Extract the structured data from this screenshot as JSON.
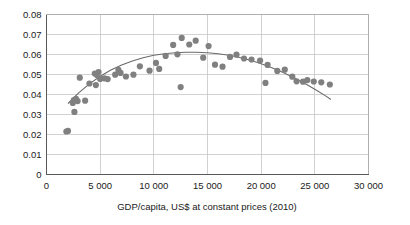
{
  "chart_data": {
    "type": "scatter",
    "title": "",
    "subtitle": "",
    "xlabel": "GDP/capita, US$ at constant prices (2010)",
    "ylabel": "",
    "xlim": [
      0,
      30000
    ],
    "ylim": [
      0,
      0.08
    ],
    "grid": true,
    "legend": "none",
    "x_ticks": [
      0,
      5000,
      10000,
      15000,
      20000,
      25000,
      30000
    ],
    "x_tick_labels": [
      "0",
      "5 000",
      "10 000",
      "15 000",
      "20 000",
      "25 000",
      "30 000"
    ],
    "y_ticks": [
      0,
      0.01,
      0.02,
      0.03,
      0.04,
      0.05,
      0.06,
      0.07,
      0.08
    ],
    "y_tick_labels": [
      "0",
      "0.01",
      "0.02",
      "0.03",
      "0.04",
      "0.05",
      "0.06",
      "0.07",
      "0.08"
    ],
    "marker_color": "#808080",
    "trendline_color": "#6b6b6b",
    "gridline_color": "#bfbfbf",
    "series": [
      {
        "name": "countries",
        "marker": "circle",
        "points": [
          [
            1850,
            0.0215
          ],
          [
            2000,
            0.0218
          ],
          [
            2600,
            0.0313
          ],
          [
            2550,
            0.0372
          ],
          [
            2900,
            0.0367
          ],
          [
            3600,
            0.0369
          ],
          [
            2450,
            0.0358
          ],
          [
            2750,
            0.0378
          ],
          [
            3100,
            0.0484
          ],
          [
            4000,
            0.0455
          ],
          [
            4500,
            0.0505
          ],
          [
            4700,
            0.0497
          ],
          [
            4850,
            0.0512
          ],
          [
            5000,
            0.0478
          ],
          [
            5400,
            0.0481
          ],
          [
            5700,
            0.0477
          ],
          [
            4600,
            0.0447
          ],
          [
            6400,
            0.0499
          ],
          [
            6700,
            0.0523
          ],
          [
            6900,
            0.0508
          ],
          [
            7400,
            0.049
          ],
          [
            8100,
            0.0499
          ],
          [
            8700,
            0.0541
          ],
          [
            9600,
            0.0519
          ],
          [
            10200,
            0.0558
          ],
          [
            10500,
            0.0528
          ],
          [
            11100,
            0.0593
          ],
          [
            11800,
            0.0648
          ],
          [
            12200,
            0.0601
          ],
          [
            12600,
            0.0683
          ],
          [
            12500,
            0.0437
          ],
          [
            13300,
            0.065
          ],
          [
            13900,
            0.0669
          ],
          [
            14600,
            0.0584
          ],
          [
            15100,
            0.0642
          ],
          [
            15700,
            0.0549
          ],
          [
            16400,
            0.0539
          ],
          [
            17100,
            0.0588
          ],
          [
            17700,
            0.0599
          ],
          [
            18400,
            0.058
          ],
          [
            19100,
            0.0575
          ],
          [
            19900,
            0.057
          ],
          [
            20600,
            0.0548
          ],
          [
            20400,
            0.0458
          ],
          [
            21500,
            0.0518
          ],
          [
            22200,
            0.0524
          ],
          [
            22900,
            0.0489
          ],
          [
            23300,
            0.0466
          ],
          [
            23900,
            0.0464
          ],
          [
            24300,
            0.0472
          ],
          [
            24900,
            0.0465
          ],
          [
            25600,
            0.0461
          ],
          [
            26400,
            0.045
          ]
        ]
      }
    ],
    "trendline": {
      "type": "quadratic",
      "x_start": 2000,
      "x_end": 26500,
      "points": [
        [
          2000,
          0.0355
        ],
        [
          3000,
          0.0408
        ],
        [
          4000,
          0.0453
        ],
        [
          5000,
          0.0491
        ],
        [
          6000,
          0.0522
        ],
        [
          7000,
          0.0547
        ],
        [
          8000,
          0.0568
        ],
        [
          9000,
          0.0584
        ],
        [
          10000,
          0.0596
        ],
        [
          11000,
          0.0604
        ],
        [
          12000,
          0.0609
        ],
        [
          13000,
          0.0611
        ],
        [
          14000,
          0.0611
        ],
        [
          15000,
          0.0609
        ],
        [
          16000,
          0.0604
        ],
        [
          17000,
          0.0596
        ],
        [
          18000,
          0.0585
        ],
        [
          19000,
          0.0571
        ],
        [
          20000,
          0.0554
        ],
        [
          21000,
          0.0534
        ],
        [
          22000,
          0.0511
        ],
        [
          23000,
          0.0485
        ],
        [
          24000,
          0.0457
        ],
        [
          25000,
          0.0426
        ],
        [
          26000,
          0.0393
        ],
        [
          26500,
          0.0375
        ]
      ]
    }
  }
}
